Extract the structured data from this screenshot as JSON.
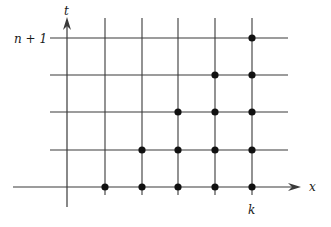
{
  "diagram": {
    "type": "stencil-grid",
    "axes": {
      "horizontal_label": "x",
      "vertical_label": "t"
    },
    "labels": {
      "top_row": "n + 1",
      "column": "k"
    },
    "grid": {
      "columns_x": [
        105,
        142,
        178,
        215,
        252
      ],
      "rows_y": [
        38,
        75,
        112,
        150,
        187
      ],
      "axis_x": 67,
      "axis_y": 187
    },
    "points": [
      {
        "x": 252,
        "y": 38
      },
      {
        "x": 215,
        "y": 75
      },
      {
        "x": 252,
        "y": 75
      },
      {
        "x": 178,
        "y": 112
      },
      {
        "x": 215,
        "y": 112
      },
      {
        "x": 252,
        "y": 112
      },
      {
        "x": 142,
        "y": 150
      },
      {
        "x": 178,
        "y": 150
      },
      {
        "x": 215,
        "y": 150
      },
      {
        "x": 252,
        "y": 150
      },
      {
        "x": 105,
        "y": 187
      },
      {
        "x": 142,
        "y": 187
      },
      {
        "x": 178,
        "y": 187
      },
      {
        "x": 215,
        "y": 187
      },
      {
        "x": 252,
        "y": 187
      }
    ],
    "colors": {
      "line": "#3a3a3a",
      "point": "#111111"
    }
  }
}
